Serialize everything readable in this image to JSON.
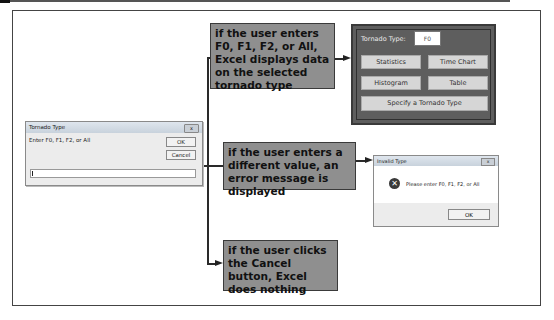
{
  "callouts": [
    {
      "text": "if the user enters F0, F1, F2, or All, Excel displays data on the selected tornado type"
    },
    {
      "text": "if the user enters a different value, an error message is displayed"
    },
    {
      "text": "if the user clicks the Cancel button, Excel does nothing"
    }
  ],
  "input_dialog": {
    "title": "Tornado Type",
    "prompt": "Enter F0, F1, F2, or All",
    "ok_label": "OK",
    "cancel_label": "Cancel",
    "input_value": "",
    "close_glyph": "x"
  },
  "tornado_panel": {
    "label": "Tornado Type:",
    "value": "F0",
    "buttons": [
      {
        "label": "Statistics"
      },
      {
        "label": "Time Chart"
      },
      {
        "label": "Histogram"
      },
      {
        "label": "Table"
      },
      {
        "label": "Specify a Tornado Type"
      }
    ]
  },
  "error_dialog": {
    "title": "Invalid Type",
    "message": "Please enter F0, F1, F2, or All",
    "ok_label": "OK",
    "icon": "error-x-icon",
    "close_glyph": "x"
  },
  "colors": {
    "callout_bg": "#8f8f8f",
    "panel_bg": "#5e5e5e",
    "frame_border": "#444444"
  }
}
